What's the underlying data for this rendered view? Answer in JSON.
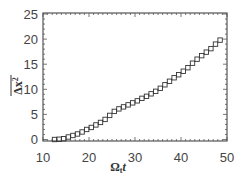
{
  "chart_data": {
    "type": "scatter",
    "title": "",
    "xlabel": "Ω_t t",
    "ylabel": "overline(Δx²)",
    "xlabel_parts": {
      "main": "Ω",
      "sub": "t",
      "tail": "t"
    },
    "ylabel_parts": {
      "main": "Δx",
      "sup": "2"
    },
    "xlim": [
      10,
      50
    ],
    "ylim": [
      -1,
      25
    ],
    "xticks": [
      10,
      20,
      30,
      40,
      50
    ],
    "yticks": [
      0,
      5,
      10,
      15,
      20,
      25
    ],
    "grid": false,
    "legend": null,
    "marker": "open-square",
    "series": [
      {
        "name": "data",
        "x": [
          12.5,
          13.5,
          14.5,
          15.5,
          16.5,
          17.5,
          18.5,
          19.5,
          20.5,
          21.5,
          22.5,
          23.5,
          24.5,
          25.5,
          26.5,
          27.5,
          28.5,
          29.5,
          30.5,
          31.5,
          32.5,
          33.5,
          34.5,
          35.5,
          36.5,
          37.5,
          38.5,
          39.5,
          40.5,
          41.5,
          42.5,
          43.5,
          44.5,
          45.5,
          46.5,
          47.5,
          48.5
        ],
        "y": [
          0.0,
          0.05,
          0.15,
          0.5,
          0.8,
          1.1,
          1.5,
          2.0,
          2.4,
          2.9,
          3.4,
          4.0,
          4.8,
          5.6,
          6.1,
          6.5,
          6.9,
          7.3,
          7.7,
          8.2,
          8.6,
          9.1,
          9.6,
          10.2,
          10.9,
          11.6,
          12.3,
          12.9,
          13.6,
          14.3,
          15.2,
          16.0,
          16.7,
          17.4,
          18.1,
          19.0,
          19.8
        ]
      }
    ]
  }
}
